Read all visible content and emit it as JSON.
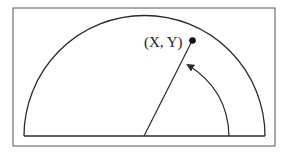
{
  "diagram": {
    "type": "semicircle-polar-coordinate",
    "point_label": "(X, Y)",
    "colors": {
      "stroke": "#2a2a2a",
      "frame": "#555555",
      "background": "#ffffff",
      "point": "#111111"
    }
  }
}
